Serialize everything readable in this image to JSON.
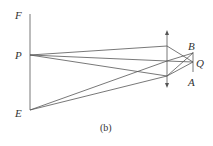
{
  "labels": {
    "F": "F",
    "P": "P",
    "E": "E",
    "B": "B",
    "Q": "Q",
    "A": "A"
  },
  "caption": "(b)",
  "colors": {
    "line": "#555555",
    "text": "#333333",
    "background": "#ffffff"
  }
}
